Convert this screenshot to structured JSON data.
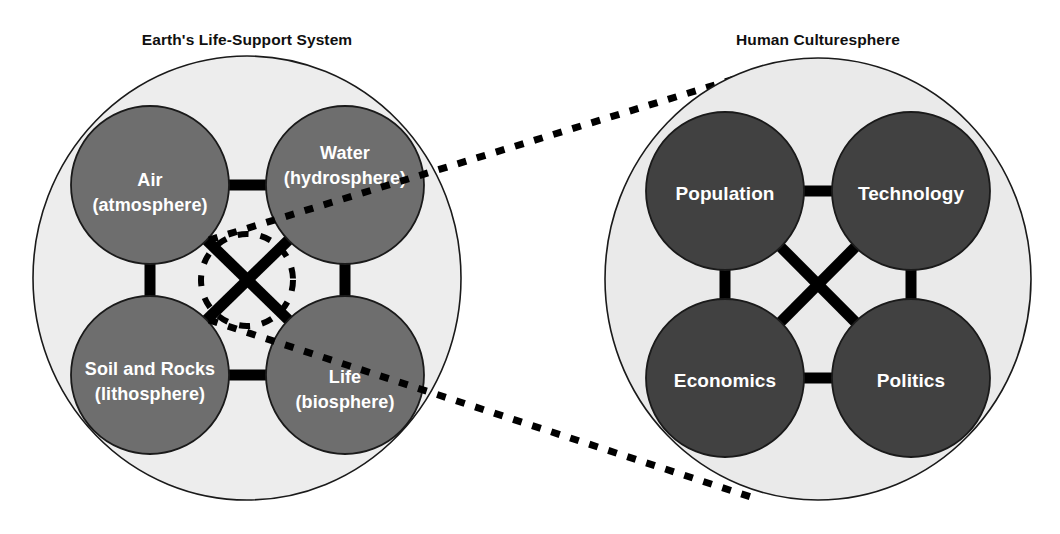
{
  "figure": {
    "type": "conceptual-diagram",
    "background_color": "#ffffff"
  },
  "left_group": {
    "title": "Earth's Life-Support System",
    "container_fill": "#ededed",
    "container_stroke": "#1a1a1a",
    "node_fill": "#6e6e6e",
    "node_stroke": "#1a1a1a",
    "node_text_color": "#ffffff",
    "connector_color": "#000000",
    "has_center_dashed_circle": true,
    "nodes": [
      {
        "id": "air",
        "line1": "Air",
        "line2": "(atmosphere)"
      },
      {
        "id": "water",
        "line1": "Water",
        "line2": "(hydrosphere)"
      },
      {
        "id": "soil",
        "line1": "Soil and Rocks",
        "line2": "(lithosphere)"
      },
      {
        "id": "life",
        "line1": "Life",
        "line2": "(biosphere)"
      }
    ]
  },
  "right_group": {
    "title": "Human Culturesphere",
    "container_fill": "#eaeaea",
    "container_stroke": "#1a1a1a",
    "node_fill": "#414141",
    "node_stroke": "#1a1a1a",
    "node_text_color": "#ffffff",
    "connector_color": "#000000",
    "has_center_dashed_circle": false,
    "nodes": [
      {
        "id": "population",
        "line1": "Population",
        "line2": ""
      },
      {
        "id": "technology",
        "line1": "Technology",
        "line2": ""
      },
      {
        "id": "economics",
        "line1": "Economics",
        "line2": ""
      },
      {
        "id": "politics",
        "line1": "Politics",
        "line2": ""
      }
    ]
  },
  "zoom_connectors": {
    "style": "dotted",
    "color": "#000000",
    "count": 2,
    "description": "Two dotted lines fan out from the dashed circle at the center of the Earth's Life-Support System toward the Human Culturesphere."
  }
}
